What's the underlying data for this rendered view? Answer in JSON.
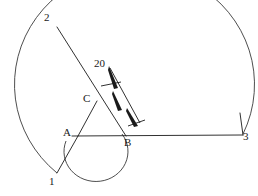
{
  "figure": {
    "type": "geometry-diagram",
    "stroke_color": "#3a3a3a",
    "fill_color": "#1a1a1a",
    "background_color": "#ffffff",
    "labels": {
      "point_1": "1",
      "point_2": "2",
      "point_3": "3",
      "point_a": "A",
      "point_b": "B",
      "point_c": "C",
      "dimension": "20"
    },
    "points": {
      "a": {
        "x": 78,
        "y": 136
      },
      "b": {
        "x": 122,
        "y": 134
      },
      "c": {
        "x": 97,
        "y": 102
      },
      "p1": {
        "x": 57,
        "y": 173
      },
      "p2": {
        "x": 57,
        "y": 27
      },
      "p3": {
        "x": 243,
        "y": 134
      }
    },
    "arcs": {
      "major_arc": {
        "center_x": 78,
        "center_y": 136,
        "radius": 165,
        "start_label": "1",
        "end_label": "3"
      },
      "minor_arc": {
        "center_x": 100,
        "center_y": 134,
        "radius": 22,
        "start_label": "B"
      }
    },
    "dimension_line": {
      "value": "20",
      "arrowheads": 2,
      "from_x": 110,
      "from_y": 69,
      "to_x": 139,
      "to_y": 122
    }
  }
}
